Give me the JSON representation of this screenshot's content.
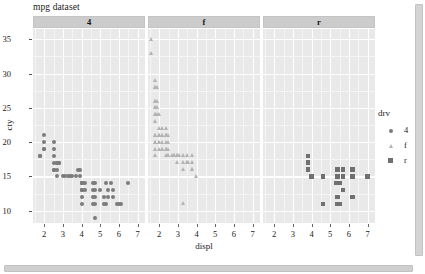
{
  "window": {
    "vertical_scrollbar": "vertical-scrollbar",
    "horizontal_scrollbar": "horizontal-scrollbar"
  },
  "chart_data": {
    "type": "scatter",
    "title": "mpg dataset",
    "xlabel": "displ",
    "ylabel": "cty",
    "xlim": [
      1.4,
      7.4
    ],
    "ylim": [
      8.2,
      36.5
    ],
    "xticks": [
      2,
      3,
      4,
      5,
      6,
      7
    ],
    "yticks": [
      10,
      15,
      20,
      25,
      30,
      35
    ],
    "grid": true,
    "facet_variable": "drv",
    "facet_labels": [
      "4",
      "f",
      "r"
    ],
    "legend": {
      "title": "drv",
      "position": "right",
      "entries": [
        {
          "label": "4",
          "shape": "circle",
          "color": "#7b7b7b"
        },
        {
          "label": "f",
          "shape": "triangle",
          "color": "#b3b3b3"
        },
        {
          "label": "r",
          "shape": "square",
          "color": "#707070"
        }
      ]
    },
    "series": [
      {
        "name": "4",
        "shape": "circle",
        "color": "#7b7b7b",
        "points": [
          [
            1.8,
            18
          ],
          [
            1.8,
            18
          ],
          [
            2.0,
            21
          ],
          [
            2.0,
            20
          ],
          [
            2.0,
            19
          ],
          [
            2.0,
            19
          ],
          [
            2.5,
            20
          ],
          [
            2.5,
            19
          ],
          [
            2.5,
            18
          ],
          [
            2.5,
            17
          ],
          [
            2.5,
            16
          ],
          [
            2.5,
            16
          ],
          [
            2.7,
            17
          ],
          [
            2.7,
            17
          ],
          [
            2.7,
            16
          ],
          [
            2.7,
            15
          ],
          [
            2.8,
            17
          ],
          [
            2.8,
            17
          ],
          [
            3.0,
            15
          ],
          [
            3.1,
            15
          ],
          [
            3.3,
            15
          ],
          [
            3.4,
            15
          ],
          [
            3.5,
            15
          ],
          [
            3.7,
            15
          ],
          [
            3.8,
            16
          ],
          [
            3.9,
            16
          ],
          [
            3.9,
            15
          ],
          [
            4.0,
            14
          ],
          [
            4.0,
            14
          ],
          [
            4.0,
            14
          ],
          [
            4.0,
            14
          ],
          [
            4.0,
            13
          ],
          [
            4.0,
            13
          ],
          [
            4.0,
            13
          ],
          [
            4.0,
            12
          ],
          [
            4.0,
            11
          ],
          [
            4.2,
            14
          ],
          [
            4.2,
            13
          ],
          [
            4.6,
            14
          ],
          [
            4.6,
            13
          ],
          [
            4.6,
            12
          ],
          [
            4.6,
            11
          ],
          [
            4.7,
            14
          ],
          [
            4.7,
            13
          ],
          [
            4.7,
            12
          ],
          [
            4.7,
            11
          ],
          [
            4.7,
            9
          ],
          [
            5.0,
            13
          ],
          [
            5.2,
            12
          ],
          [
            5.2,
            11
          ],
          [
            5.3,
            14
          ],
          [
            5.3,
            11
          ],
          [
            5.4,
            13
          ],
          [
            5.4,
            12
          ],
          [
            5.6,
            14
          ],
          [
            5.7,
            13
          ],
          [
            5.7,
            12
          ],
          [
            5.9,
            11
          ],
          [
            6.0,
            11
          ],
          [
            6.1,
            11
          ],
          [
            6.5,
            14
          ]
        ]
      },
      {
        "name": "f",
        "shape": "triangle",
        "color": "#b3b3b3",
        "points": [
          [
            1.6,
            35
          ],
          [
            1.6,
            33
          ],
          [
            1.8,
            29
          ],
          [
            1.8,
            28
          ],
          [
            1.8,
            28
          ],
          [
            1.8,
            26
          ],
          [
            1.8,
            26
          ],
          [
            1.8,
            25
          ],
          [
            1.8,
            25
          ],
          [
            1.8,
            24
          ],
          [
            1.8,
            24
          ],
          [
            1.8,
            23
          ],
          [
            1.8,
            21
          ],
          [
            1.8,
            21
          ],
          [
            1.8,
            20
          ],
          [
            1.8,
            20
          ],
          [
            1.8,
            19
          ],
          [
            1.8,
            18
          ],
          [
            1.9,
            28
          ],
          [
            1.9,
            26
          ],
          [
            1.9,
            25
          ],
          [
            1.9,
            24
          ],
          [
            2.0,
            24
          ],
          [
            2.0,
            22
          ],
          [
            2.0,
            21
          ],
          [
            2.0,
            21
          ],
          [
            2.0,
            21
          ],
          [
            2.0,
            20
          ],
          [
            2.0,
            20
          ],
          [
            2.0,
            19
          ],
          [
            2.2,
            22
          ],
          [
            2.2,
            21
          ],
          [
            2.2,
            21
          ],
          [
            2.2,
            20
          ],
          [
            2.2,
            19
          ],
          [
            2.2,
            19
          ],
          [
            2.4,
            22
          ],
          [
            2.4,
            21
          ],
          [
            2.4,
            21
          ],
          [
            2.4,
            21
          ],
          [
            2.4,
            20
          ],
          [
            2.4,
            19
          ],
          [
            2.4,
            19
          ],
          [
            2.4,
            18
          ],
          [
            2.5,
            21
          ],
          [
            2.5,
            20
          ],
          [
            2.5,
            19
          ],
          [
            2.5,
            18
          ],
          [
            2.5,
            18
          ],
          [
            2.7,
            18
          ],
          [
            2.8,
            18
          ],
          [
            2.8,
            18
          ],
          [
            3.0,
            18
          ],
          [
            3.0,
            18
          ],
          [
            3.0,
            17
          ],
          [
            3.1,
            18
          ],
          [
            3.3,
            18
          ],
          [
            3.3,
            17
          ],
          [
            3.3,
            16
          ],
          [
            3.5,
            18
          ],
          [
            3.5,
            17
          ],
          [
            3.5,
            17
          ],
          [
            3.6,
            17
          ],
          [
            3.8,
            18
          ],
          [
            3.8,
            17
          ],
          [
            3.8,
            16
          ],
          [
            3.8,
            16
          ],
          [
            4.0,
            15
          ],
          [
            3.3,
            11
          ]
        ]
      },
      {
        "name": "r",
        "shape": "square",
        "color": "#707070",
        "points": [
          [
            3.8,
            18
          ],
          [
            3.8,
            17
          ],
          [
            3.8,
            16
          ],
          [
            4.0,
            15
          ],
          [
            4.6,
            15
          ],
          [
            4.6,
            11
          ],
          [
            5.3,
            14
          ],
          [
            5.4,
            16
          ],
          [
            5.4,
            15
          ],
          [
            5.4,
            14
          ],
          [
            5.4,
            12
          ],
          [
            5.4,
            11
          ],
          [
            5.7,
            16
          ],
          [
            5.7,
            15
          ],
          [
            5.7,
            13
          ],
          [
            6.2,
            16
          ],
          [
            6.2,
            15
          ],
          [
            6.2,
            12
          ],
          [
            7.0,
            15
          ],
          [
            5.5,
            11
          ],
          [
            5.5,
            14
          ]
        ]
      }
    ]
  }
}
